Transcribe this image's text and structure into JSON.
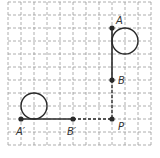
{
  "diagram": {
    "type": "geometry-transformation-grid",
    "grid": {
      "cols": 11,
      "rows": 11,
      "spacing": 13,
      "origin_x": 8,
      "origin_y": 2,
      "style": "dashed"
    },
    "points": [
      {
        "id": "A",
        "label": "A",
        "x": 112,
        "y": 28
      },
      {
        "id": "B",
        "label": "B",
        "x": 112,
        "y": 80
      },
      {
        "id": "P",
        "label": "P",
        "x": 112,
        "y": 119
      },
      {
        "id": "A_prime",
        "label": "A′",
        "x": 21,
        "y": 119
      },
      {
        "id": "B_prime",
        "label": "B′",
        "x": 73,
        "y": 119
      }
    ],
    "segments": [
      {
        "from": "A",
        "to": "B",
        "style": "solid"
      },
      {
        "from": "B",
        "to": "P",
        "style": "dashed"
      },
      {
        "from": "A_prime",
        "to": "B_prime",
        "style": "solid"
      },
      {
        "from": "B_prime",
        "to": "P",
        "style": "dashed"
      }
    ],
    "circles": [
      {
        "id": "original-circle",
        "cx": 125,
        "cy": 41,
        "r": 13
      },
      {
        "id": "image-circle",
        "cx": 34,
        "cy": 106,
        "r": 13
      }
    ],
    "colors": {
      "line": "#2a2a2a",
      "grid": "#9a9a9a",
      "background": "#ffffff"
    }
  }
}
